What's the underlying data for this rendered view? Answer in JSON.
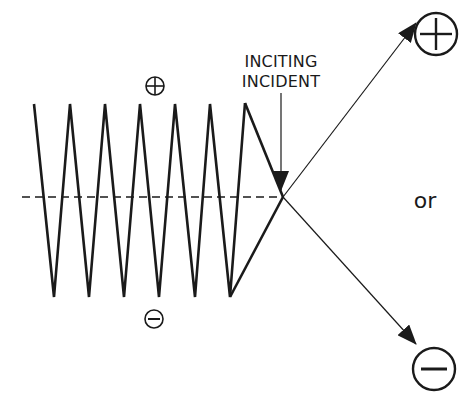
{
  "diagram": {
    "title": "",
    "labels": {
      "inciting_line1": "INCITING",
      "inciting_line2": "INCIDENT",
      "or": "or"
    },
    "symbols": {
      "small_positive": "plus-circle-icon",
      "small_negative": "minus-circle-icon",
      "large_positive": "plus-circle-icon",
      "large_negative": "minus-circle-icon"
    },
    "colors": {
      "stroke": "#1a1a1a",
      "background": "#ffffff"
    },
    "zigzag": {
      "peak_y": 104,
      "trough_y": 297,
      "peaks_x": [
        34,
        70,
        105,
        140,
        175,
        210,
        245
      ],
      "troughs_x": [
        54,
        89,
        124,
        159,
        195,
        230
      ]
    },
    "convergence_point": [
      283,
      197
    ],
    "baseline_y": 197
  }
}
